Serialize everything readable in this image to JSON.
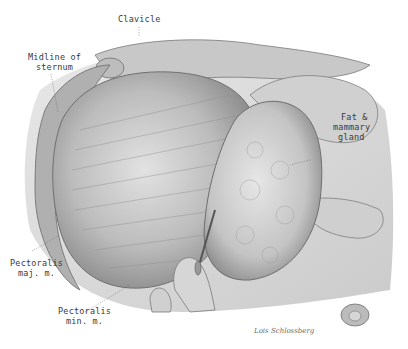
{
  "figure": {
    "colors": {
      "background": "#ffffff",
      "tissue_light": "#d9d9d9",
      "tissue_mid": "#a8a8a8",
      "tissue_dark": "#6e6e6e",
      "label_text": "#3a3a3a"
    }
  },
  "labels": {
    "clavicle": "Clavicle",
    "midline_line1": "Midline of",
    "midline_line2": "sternum",
    "fat_line1": "Fat &",
    "fat_line2": "mammary",
    "fat_line3": "gland",
    "pect_maj_line1": "Pectoralis",
    "pect_maj_line2": "maj. m.",
    "pect_min_line1": "Pectoralis",
    "pect_min_line2": "min. m."
  },
  "signature": "Lois Schlossberg"
}
